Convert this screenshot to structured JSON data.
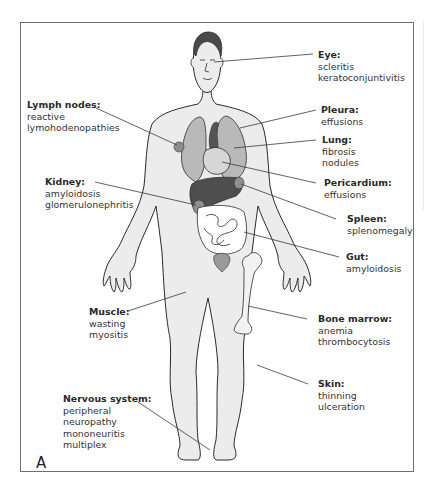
{
  "figure": {
    "panel_label": "A",
    "colors": {
      "skin": "#ececec",
      "outline": "#2b2b2b",
      "hair": "#4a4a4a",
      "lung": "#b9b9b9",
      "heart": "#d6d6d6",
      "liver": "#4e4e4e",
      "vessels": "#555555",
      "spleen_kidney": "#8e8e8e",
      "bladder": "#9a9a9a",
      "intestine": "#ffffff",
      "bone": "#f2f2f2",
      "leader_line": "#3a3a3a",
      "frame": "#6e6e6e"
    },
    "annotations": [
      {
        "id": "eye",
        "title": "Eye:",
        "items": [
          "scleritis",
          "keratoconjuntivitis"
        ]
      },
      {
        "id": "lymph-nodes",
        "title": "Lymph nodes:",
        "items": [
          "reactive",
          "lymohodenopathies"
        ]
      },
      {
        "id": "pleura",
        "title": "Pleura:",
        "items": [
          "effusions"
        ]
      },
      {
        "id": "lung",
        "title": "Lung:",
        "items": [
          "fibrosis",
          "nodules"
        ]
      },
      {
        "id": "kidney",
        "title": "Kidney:",
        "items": [
          "amyloidosis",
          "glomerulonephritis"
        ]
      },
      {
        "id": "pericardium",
        "title": "Pericardium:",
        "items": [
          "effusions"
        ]
      },
      {
        "id": "spleen",
        "title": "Spleen:",
        "items": [
          "splenomegaly"
        ]
      },
      {
        "id": "gut",
        "title": "Gut:",
        "items": [
          "amyloidosis"
        ]
      },
      {
        "id": "muscle",
        "title": "Muscle:",
        "items": [
          "wasting",
          "myositis"
        ]
      },
      {
        "id": "bone-marrow",
        "title": "Bone marrow:",
        "items": [
          "anemia",
          "thrombocytosis"
        ]
      },
      {
        "id": "skin",
        "title": "Skin:",
        "items": [
          "thinning",
          "ulceration"
        ]
      },
      {
        "id": "nervous-system",
        "title": "Nervous system:",
        "items": [
          "peripheral",
          "neuropathy",
          "mononeuritis",
          "multiplex"
        ]
      }
    ]
  }
}
